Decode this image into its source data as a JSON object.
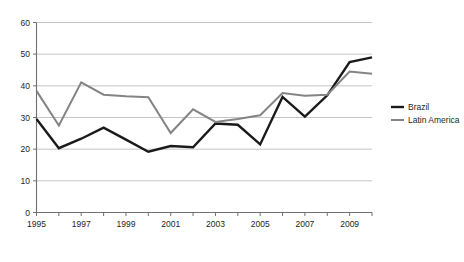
{
  "chart_data": {
    "type": "line",
    "title": "",
    "subtitle": "",
    "xlabel": "",
    "ylabel": "",
    "x": [
      1995,
      1996,
      1997,
      1998,
      1999,
      2000,
      2001,
      2002,
      2003,
      2004,
      2005,
      2006,
      2007,
      2008,
      2009,
      2010
    ],
    "categories": [
      "1995",
      "1996",
      "1997",
      "1998",
      "1999",
      "2000",
      "2001",
      "2002",
      "2003",
      "2004",
      "2005",
      "2006",
      "2007",
      "2008",
      "2009",
      "2010"
    ],
    "xtick_labels": [
      "1995",
      "",
      "1997",
      "",
      "1999",
      "",
      "2001",
      "",
      "2003",
      "",
      "2005",
      "",
      "2007",
      "",
      "2009",
      ""
    ],
    "xtick_labels_shown": [
      "1995",
      "1997",
      "1999",
      "2001",
      "2003",
      "2005",
      "2007",
      "2009"
    ],
    "ytick_labels": [
      "0",
      "10",
      "20",
      "30",
      "40",
      "50",
      "60"
    ],
    "yticks": [
      0,
      10,
      20,
      30,
      40,
      50,
      60
    ],
    "xlim": [
      1995,
      2010
    ],
    "ylim": [
      0,
      60
    ],
    "grid": true,
    "grid_axis": "y",
    "legend_position": "right",
    "series": [
      {
        "name": "Brazil",
        "color": "#1a1a1a",
        "width": 2.4,
        "values": [
          29.5,
          20.3,
          23.3,
          26.8,
          23.0,
          19.2,
          21.0,
          20.6,
          28.1,
          27.7,
          21.5,
          36.5,
          30.3,
          37.0,
          47.5,
          49.0
        ]
      },
      {
        "name": "Latin America",
        "color": "#848484",
        "width": 2.0,
        "values": [
          38.4,
          27.5,
          41.1,
          37.2,
          36.7,
          36.4,
          25.1,
          32.6,
          28.6,
          29.5,
          30.7,
          37.7,
          36.9,
          37.2,
          44.5,
          43.8
        ]
      }
    ],
    "legend": [
      {
        "label": "Brazil",
        "color": "#1a1a1a"
      },
      {
        "label": "Latin America",
        "color": "#848484"
      }
    ]
  }
}
